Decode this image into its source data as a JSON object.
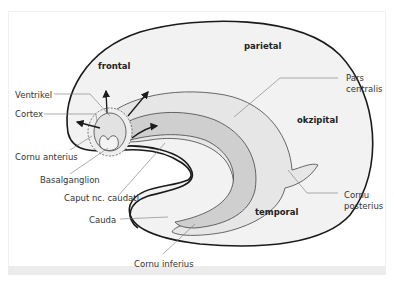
{
  "diagram": {
    "regions": {
      "frontal": "frontal",
      "parietal": "parietal",
      "okzipital": "okzipital",
      "temporal": "temporal"
    },
    "labels": {
      "ventrikel": "Ventrikel",
      "cortex": "Cortex",
      "cornu_anterius": "Cornu anterius",
      "basalganglion": "Basalganglion",
      "caput": "Caput nc. caudati",
      "cauda": "Cauda",
      "cornu_inferius": "Cornu inferius",
      "pars_centralis_1": "Pars",
      "pars_centralis_2": "centralis",
      "cornu_posterius_1": "Cornu",
      "cornu_posterius_2": "posterius"
    },
    "colors": {
      "hemisphere_fill": "#f2f2f2",
      "ventricle_fill": "#e4e4e4",
      "caudate_fill": "#cfcfcf",
      "outline": "#1a1a1a",
      "leader_line": "#777777",
      "bottom_strip": "#ececec"
    }
  }
}
